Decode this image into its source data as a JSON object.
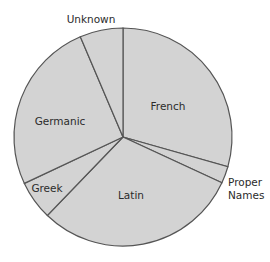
{
  "chart_data": {
    "type": "pie",
    "title": "",
    "start_angle_deg": 0,
    "direction": "clockwise",
    "categories": [
      "French",
      "Proper Names",
      "Latin",
      "Greek",
      "Germanic",
      "Unknown"
    ],
    "values": [
      29.4,
      2.5,
      30.3,
      5.8,
      25.6,
      6.4
    ],
    "value_unit": "percent (estimated from slice angles)",
    "slice_labels": [
      {
        "text": [
          "French"
        ],
        "x": 168,
        "y": 110,
        "anchor": "middle"
      },
      {
        "text": [
          "Proper",
          "Names"
        ],
        "x": 228,
        "y": 186,
        "anchor": "start"
      },
      {
        "text": [
          "Latin"
        ],
        "x": 131,
        "y": 199,
        "anchor": "middle"
      },
      {
        "text": [
          "Greek"
        ],
        "x": 47,
        "y": 192,
        "anchor": "middle"
      },
      {
        "text": [
          "Germanic"
        ],
        "x": 60,
        "y": 125,
        "anchor": "middle"
      },
      {
        "text": [
          "Unknown"
        ],
        "x": 91,
        "y": 23,
        "anchor": "middle"
      }
    ],
    "colors": {
      "fill": "#d3d3d3",
      "stroke": "#555555",
      "text": "#2b2b2b"
    },
    "legend": "none",
    "grid": false
  },
  "geometry": {
    "cx": 123,
    "cy": 137,
    "r": 109
  }
}
